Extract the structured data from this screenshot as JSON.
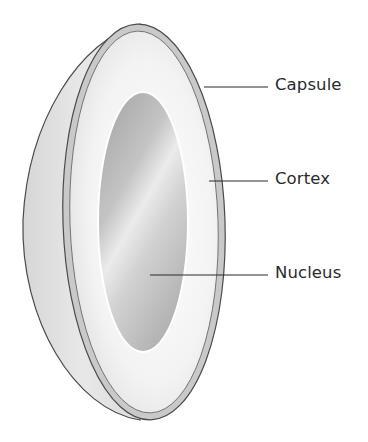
{
  "diagram": {
    "labels": [
      {
        "id": "capsule",
        "text": "Capsule",
        "y": 77
      },
      {
        "id": "cortex",
        "text": "Cortex",
        "y": 171
      },
      {
        "id": "nucleus",
        "text": "Nucleus",
        "y": 265
      }
    ],
    "colors": {
      "outline": "#4a4a4a",
      "capsule_band": "#cfcfcf",
      "cortex_fill": "#f1f1f1",
      "nucleus_dark": "#b5b5b5",
      "nucleus_light": "#ececec",
      "leader_line": "#2a2a2a",
      "label_text": "#2a2a2a"
    }
  }
}
